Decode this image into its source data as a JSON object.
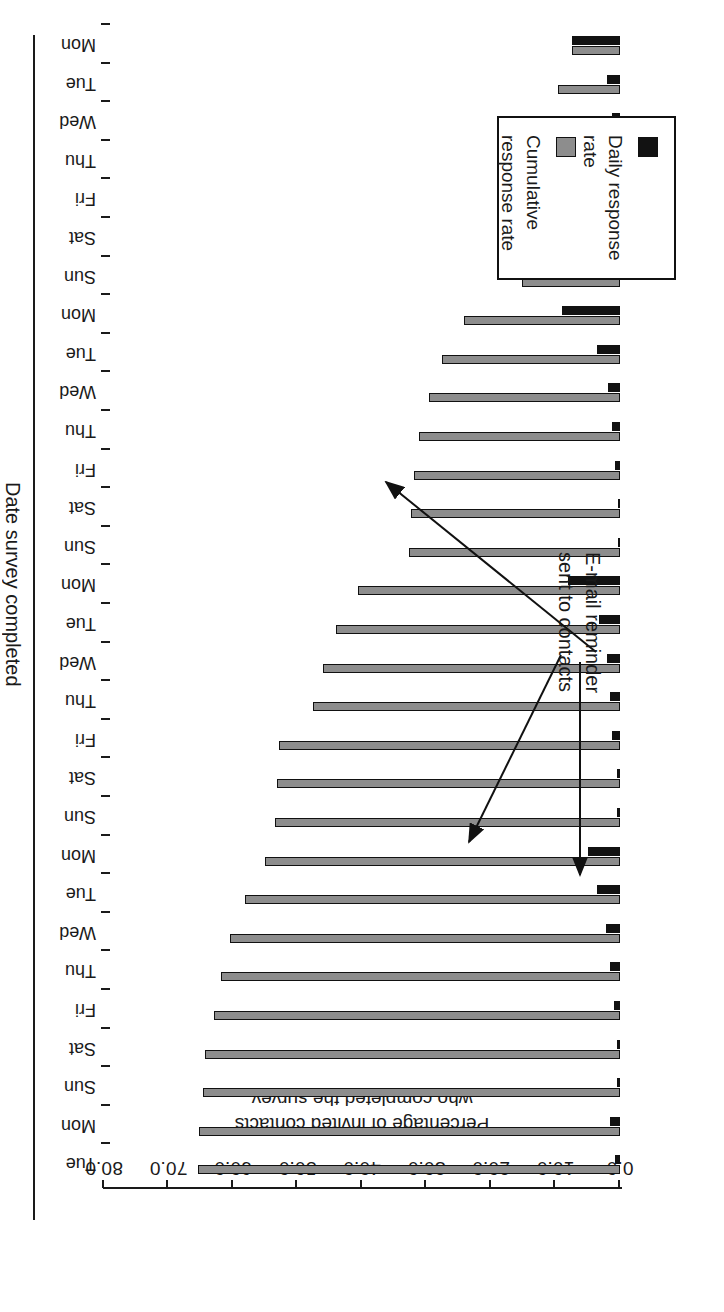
{
  "figure": {
    "orientation": "rotated-180",
    "background": "#ffffff"
  },
  "axes": {
    "value_axis": {
      "title_line1": "Percentage of invited contacts",
      "title_line2": "who completed the survey",
      "ticks": [
        "0.0",
        "10.0",
        "20.0",
        "30.0",
        "40.0",
        "50.0",
        "60.0",
        "70.0",
        "80.0"
      ],
      "min": 0,
      "max": 80,
      "step": 10
    },
    "category_axis": {
      "title": "Date survey completed"
    }
  },
  "legend": {
    "items": [
      {
        "label": "Daily response\nrate",
        "color": "#121212",
        "swatch": "black-square"
      },
      {
        "label": "Cumulative\nresponse rate",
        "color": "#8d8d8d",
        "swatch": "grey-square"
      }
    ]
  },
  "annotation": {
    "text": "E-mail reminder\nsent to contacts",
    "arrow_count": 3,
    "targets": [
      "Mon (day 8)",
      "Mon (day 15)",
      "Mon (day 22)"
    ]
  },
  "chart_data": {
    "type": "bar",
    "title": "",
    "xlabel": "Date survey completed",
    "ylabel": "Percentage of invited contacts who completed the survey",
    "ylim": [
      0,
      80
    ],
    "grid": false,
    "legend_position": "bottom-left",
    "orientation": "horizontal",
    "categories": [
      "Mon",
      "Tue",
      "Wed",
      "Thu",
      "Fri",
      "Sat",
      "Sun",
      "Mon",
      "Tue",
      "Wed",
      "Thu",
      "Fri",
      "Sat",
      "Sun",
      "Mon",
      "Tue",
      "Wed",
      "Thu",
      "Fri",
      "Sat",
      "Sun",
      "Mon",
      "Tue",
      "Wed",
      "Thu",
      "Fri",
      "Sat",
      "Sun",
      "Mon",
      "Tue"
    ],
    "series": [
      {
        "name": "Daily response rate",
        "color": "#121212",
        "values": [
          7.5,
          2.0,
          1.2,
          1.0,
          1.0,
          0.3,
          0.3,
          9.0,
          3.5,
          1.8,
          1.2,
          0.8,
          0.3,
          0.3,
          8.0,
          3.3,
          2.0,
          1.6,
          1.2,
          0.4,
          0.4,
          5.0,
          3.5,
          2.2,
          1.5,
          1.0,
          0.4,
          0.4,
          1.5,
          0.8
        ]
      },
      {
        "name": "Cumulative response rate",
        "color": "#8d8d8d",
        "values": [
          7.5,
          9.6,
          11.8,
          13.0,
          14.6,
          14.9,
          15.2,
          24.2,
          27.6,
          29.6,
          31.2,
          32.0,
          32.4,
          32.7,
          40.6,
          44.0,
          46.0,
          47.6,
          52.8,
          53.2,
          53.5,
          55.0,
          58.2,
          60.4,
          61.8,
          62.9,
          64.4,
          64.7,
          65.2,
          65.4
        ]
      }
    ]
  }
}
